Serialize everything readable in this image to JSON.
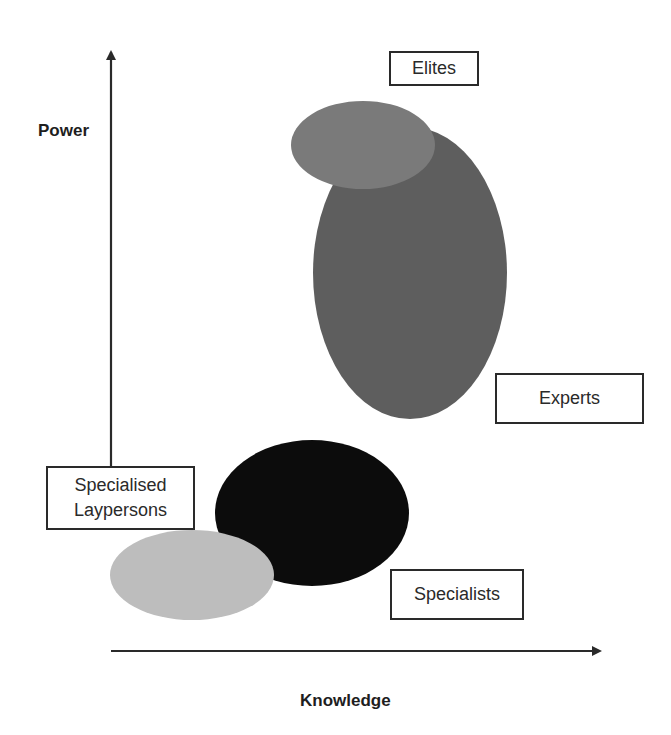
{
  "diagram": {
    "axes": {
      "y_label": "Power",
      "x_label": "Knowledge"
    },
    "groups": [
      {
        "id": "elites",
        "label": "Elites",
        "color": "#7a7a7a"
      },
      {
        "id": "experts",
        "label": "Experts",
        "color": "#5e5e5e"
      },
      {
        "id": "specialists",
        "label": "Specialists",
        "color": "#0c0c0c"
      },
      {
        "id": "specialised-laypersons",
        "label": "Specialised\nLaypersons",
        "color": "#bdbdbd"
      }
    ],
    "colors": {
      "axis": "#2a2a2a",
      "box_border": "#2a2a2a",
      "background": "#ffffff"
    }
  }
}
